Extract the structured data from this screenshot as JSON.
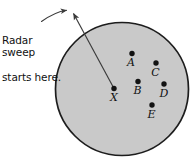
{
  "figure": {
    "width": 191,
    "height": 167,
    "background": "#ffffff"
  },
  "annotation": {
    "text": "Radar sweep\nstarts here.",
    "line1": "Radar sweep",
    "line2": "starts here.",
    "leader": {
      "type": "curved-line-with-arrow",
      "from": [
        41,
        21
      ],
      "to": [
        71,
        11
      ]
    }
  },
  "circle": {
    "name": "radar-coverage-circle",
    "cx": 122,
    "cy": 89,
    "r": 67,
    "fill": "#c9c9c9",
    "stroke": "#1d1d1d",
    "stroke_width": 1.6
  },
  "sweep_line": {
    "name": "radar-sweep-ray",
    "from": [
      114,
      89
    ],
    "to": [
      72,
      12
    ],
    "stroke": "#3a3a3a",
    "stroke_width": 1.2,
    "arrow_at": "to"
  },
  "points": [
    {
      "id": "X",
      "label": "X",
      "cx": 114,
      "cy": 89,
      "label_x": 114,
      "label_y": 92,
      "r": 2.6
    },
    {
      "id": "A",
      "label": "A",
      "cx": 132,
      "cy": 54,
      "label_x": 131,
      "label_y": 56,
      "r": 2.6
    },
    {
      "id": "B",
      "label": "B",
      "cx": 138,
      "cy": 82,
      "label_x": 137,
      "label_y": 84,
      "r": 2.6
    },
    {
      "id": "C",
      "label": "C",
      "cx": 156,
      "cy": 63,
      "label_x": 155,
      "label_y": 65,
      "r": 2.6
    },
    {
      "id": "D",
      "label": "D",
      "cx": 164,
      "cy": 84,
      "label_x": 163,
      "label_y": 86,
      "r": 2.6
    },
    {
      "id": "E",
      "label": "E",
      "cx": 152,
      "cy": 105,
      "label_x": 151,
      "label_y": 107,
      "r": 2.6
    }
  ],
  "colors": {
    "point_fill": "#121212",
    "text": "#111111",
    "circle_fill": "#c9c9c9",
    "circle_stroke": "#1d1d1d",
    "page_background": "#ffffff"
  }
}
